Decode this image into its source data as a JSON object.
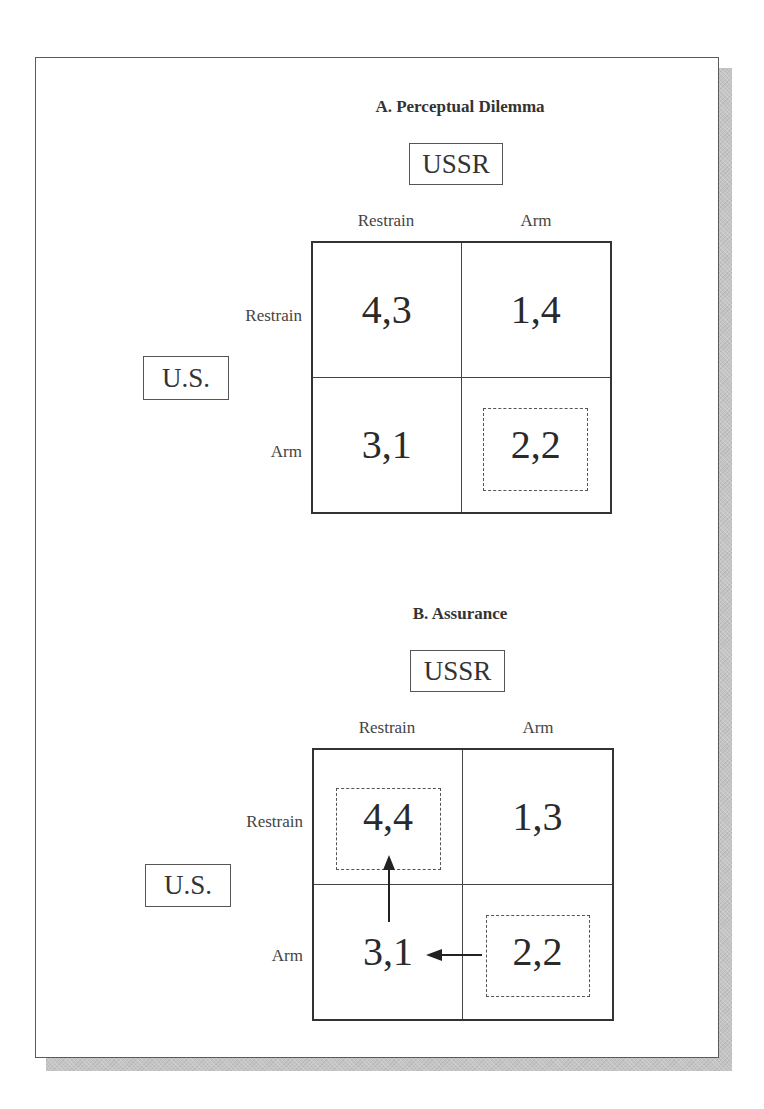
{
  "figure": {
    "panels": [
      {
        "id": "A",
        "title": "A. Perceptual Dilemma",
        "column_player": "USSR",
        "row_player": "U.S.",
        "column_strategies": [
          "Restrain",
          "Arm"
        ],
        "row_strategies": [
          "Restrain",
          "Arm"
        ],
        "payoffs": [
          [
            "4,3",
            "1,4"
          ],
          [
            "3,1",
            "2,2"
          ]
        ],
        "highlighted_cells": [
          "Arm/Arm"
        ],
        "arrows": []
      },
      {
        "id": "B",
        "title": "B. Assurance",
        "column_player": "USSR",
        "row_player": "U.S.",
        "column_strategies": [
          "Restrain",
          "Arm"
        ],
        "row_strategies": [
          "Restrain",
          "Arm"
        ],
        "payoffs": [
          [
            "4,4",
            "1,3"
          ],
          [
            "3,1",
            "2,2"
          ]
        ],
        "highlighted_cells": [
          "Restrain/Restrain",
          "Arm/Arm"
        ],
        "arrows": [
          {
            "from": "Arm/Arm",
            "to": "Arm/Restrain",
            "direction": "left"
          },
          {
            "from": "Arm/Restrain",
            "to": "Restrain/Restrain",
            "direction": "up"
          }
        ]
      }
    ]
  },
  "colors": {
    "frame_border": "#5a5a5a",
    "shadow": "#c4c4c4",
    "text": "#2a2a2a",
    "grid_line": "#333333"
  }
}
